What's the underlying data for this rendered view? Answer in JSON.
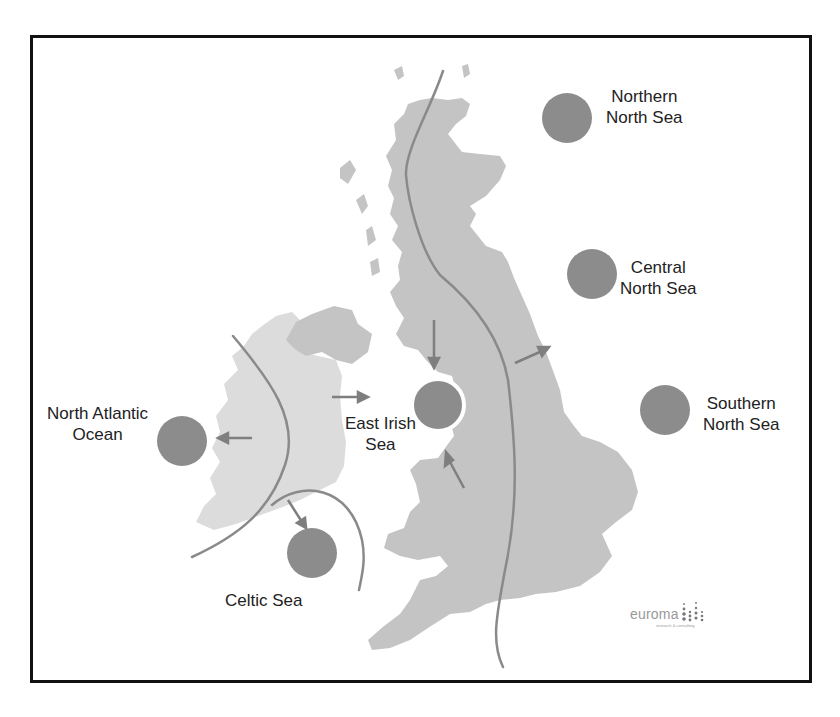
{
  "map": {
    "title": "UK sea regions",
    "colors": {
      "great_britain_fill": "#c4c4c4",
      "ireland_fill": "#dcdcdc",
      "northern_ireland_fill": "#c4c4c4",
      "region_marker": "#8c8c8c",
      "boundary_line": "#8a8a8a",
      "frame": "#111111"
    },
    "regions": [
      {
        "id": "northern-north-sea",
        "line1": "Northern",
        "line2": "North Sea",
        "marker": {
          "cx": 567,
          "cy": 118,
          "r": 25
        }
      },
      {
        "id": "central-north-sea",
        "line1": "Central",
        "line2": "North Sea",
        "marker": {
          "cx": 592,
          "cy": 274,
          "r": 25
        }
      },
      {
        "id": "southern-north-sea",
        "line1": "Southern",
        "line2": "North Sea",
        "marker": {
          "cx": 665,
          "cy": 410,
          "r": 25
        }
      },
      {
        "id": "east-irish-sea",
        "line1": "East Irish",
        "line2": "Sea",
        "marker": {
          "cx": 438,
          "cy": 405,
          "r": 25
        }
      },
      {
        "id": "north-atlantic-ocean",
        "line1": "North Atlantic",
        "line2": "Ocean",
        "marker": {
          "cx": 182,
          "cy": 441,
          "r": 25
        }
      },
      {
        "id": "celtic-sea",
        "line1": "Celtic Sea",
        "line2": "",
        "marker": {
          "cx": 312,
          "cy": 553,
          "r": 25
        }
      }
    ],
    "arrows": [
      {
        "from": "scotland-west",
        "to": "east-irish-sea",
        "direction": "down"
      },
      {
        "from": "wales-north",
        "to": "east-irish-sea",
        "direction": "up-left"
      },
      {
        "from": "ireland-east",
        "to": "east-irish-sea",
        "direction": "right"
      },
      {
        "from": "ireland-west",
        "to": "north-atlantic-ocean",
        "direction": "left"
      },
      {
        "from": "ireland-south",
        "to": "celtic-sea",
        "direction": "down-right"
      },
      {
        "from": "england-northeast",
        "to": "central-north-sea",
        "direction": "up-right"
      }
    ]
  },
  "logo": {
    "wordmark": "euroma",
    "tagline": "research & consulting"
  }
}
